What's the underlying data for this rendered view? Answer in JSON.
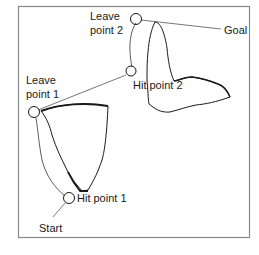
{
  "diagram": {
    "type": "bug-algorithm-path-planning",
    "labels": {
      "start": "Start",
      "goal": "Goal",
      "hit_point_1": "Hit point 1",
      "hit_point_2": "Hit point 2",
      "leave_point_1_line1": "Leave",
      "leave_point_1_line2": "point 1",
      "leave_point_2_line1": "Leave",
      "leave_point_2_line2": "point 2"
    },
    "nodes": [
      {
        "id": "start",
        "label": "Start"
      },
      {
        "id": "hit_point_1",
        "label": "Hit point 1"
      },
      {
        "id": "leave_point_1",
        "label": "Leave point 1"
      },
      {
        "id": "hit_point_2",
        "label": "Hit point 2"
      },
      {
        "id": "leave_point_2",
        "label": "Leave point 2"
      },
      {
        "id": "goal",
        "label": "Goal"
      }
    ],
    "edges": [
      {
        "from": "start",
        "to": "hit_point_1",
        "kind": "straight"
      },
      {
        "from": "hit_point_1",
        "to": "leave_point_1",
        "kind": "boundary-follow"
      },
      {
        "from": "leave_point_1",
        "to": "hit_point_2",
        "kind": "straight"
      },
      {
        "from": "hit_point_2",
        "to": "leave_point_2",
        "kind": "boundary-follow"
      },
      {
        "from": "leave_point_2",
        "to": "goal",
        "kind": "straight"
      }
    ],
    "obstacles": [
      "obstacle-1",
      "obstacle-2"
    ],
    "colors": {
      "frame": "#8a8a8a",
      "stroke": "#1a1a1a",
      "background": "#ffffff"
    }
  }
}
